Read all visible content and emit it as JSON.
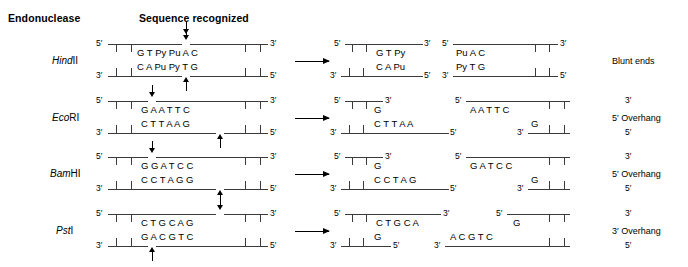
{
  "headers": {
    "endonuclease": "Endonuclease",
    "sequence_recognized": "Sequence recognized"
  },
  "labels": {
    "five_prime": "5′",
    "three_prime": "3′"
  },
  "rows": [
    {
      "enzyme_italic": "Hind",
      "enzyme_roman": "II",
      "end_type": "Blunt ends",
      "substrate": {
        "top_bases": "G T Py Pu A C",
        "bottom_bases": "C A Pu Py T G",
        "top_cut_index": 3,
        "bottom_cut_index": 3
      },
      "products": {
        "left": {
          "top_bases": "G T Py",
          "bottom_bases": "C A Pu"
        },
        "right": {
          "top_bases": "Pu A C",
          "bottom_bases": "Py T G"
        }
      }
    },
    {
      "enzyme_italic": "Eco",
      "enzyme_roman": "RI",
      "end_type": "5′ Overhang",
      "substrate": {
        "top_bases": "G A A T T C",
        "bottom_bases": "C T T A A G",
        "top_cut_index": 1,
        "bottom_cut_index": 5
      },
      "products": {
        "left": {
          "top_bases": "G",
          "bottom_bases": "C T T A A"
        },
        "right": {
          "top_bases": "A A T T C",
          "bottom_bases": "G"
        }
      }
    },
    {
      "enzyme_italic": "Bam",
      "enzyme_roman": "HI",
      "end_type": "5′ Overhang",
      "substrate": {
        "top_bases": "G G A T C C",
        "bottom_bases": "C C T A G G",
        "top_cut_index": 1,
        "bottom_cut_index": 5
      },
      "products": {
        "left": {
          "top_bases": "G",
          "bottom_bases": "C C T A G"
        },
        "right": {
          "top_bases": "G A T C C",
          "bottom_bases": "G"
        }
      }
    },
    {
      "enzyme_italic": "Pst",
      "enzyme_roman": "I",
      "end_type": "3′ Overhang",
      "substrate": {
        "top_bases": "C T G C A G",
        "bottom_bases": "G A C G T C",
        "top_cut_index": 5,
        "bottom_cut_index": 1
      },
      "products": {
        "left": {
          "top_bases": "C T G C A",
          "bottom_bases": "G"
        },
        "right": {
          "top_bases": "G",
          "bottom_bases": "A C G T C"
        }
      }
    }
  ]
}
